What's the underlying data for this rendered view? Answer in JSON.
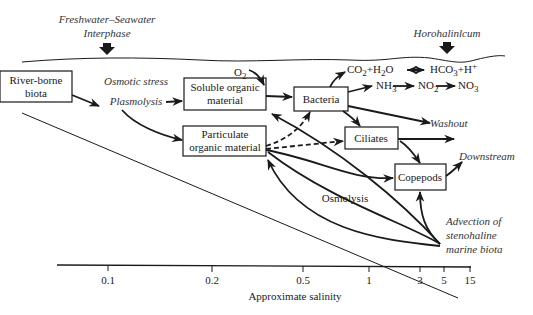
{
  "header": {
    "interphase_label_line1": "Freshwater–Seawater",
    "interphase_label_line2": "Interphase",
    "horohalinicum_label": "Horohalinlcum"
  },
  "nodes": {
    "river_biota_line1": "River-borne",
    "river_biota_line2": "biota",
    "soluble_line1": "Soluble organic",
    "soluble_line2": "material",
    "particulate_line1": "Particulate",
    "particulate_line2": "organic material",
    "bacteria": "Bacteria",
    "ciliates": "Ciliates",
    "copepods": "Copepods"
  },
  "labels": {
    "osmotic_stress": "Osmotic stress",
    "plasmolysis": "Plasmolysis",
    "osmolysis": "Osmolysis",
    "washout": "Washout",
    "downstream": "Downstream",
    "advection_line1": "Advection of",
    "advection_line2": "stenohaline",
    "advection_line3": "marine biota",
    "o2": "O",
    "o2_sub": "2",
    "co2": "CO",
    "co2_sub": "2",
    "plus_h2o_h": "+H",
    "h2o_sub": "2",
    "h2o_o": "O",
    "hco3": "HCO",
    "hco3_sub": "3",
    "hplus": "+H",
    "hplus_sup": "+",
    "nh3": "NH",
    "nh3_sub": "3",
    "no2": "NO",
    "no2_sub": "2",
    "no3": "NO",
    "no3_sub": "3"
  },
  "axis": {
    "title": "Approximate salinity",
    "ticks": [
      "0.1",
      "0.2",
      "0.5",
      "1",
      "3",
      "5",
      "15"
    ]
  }
}
